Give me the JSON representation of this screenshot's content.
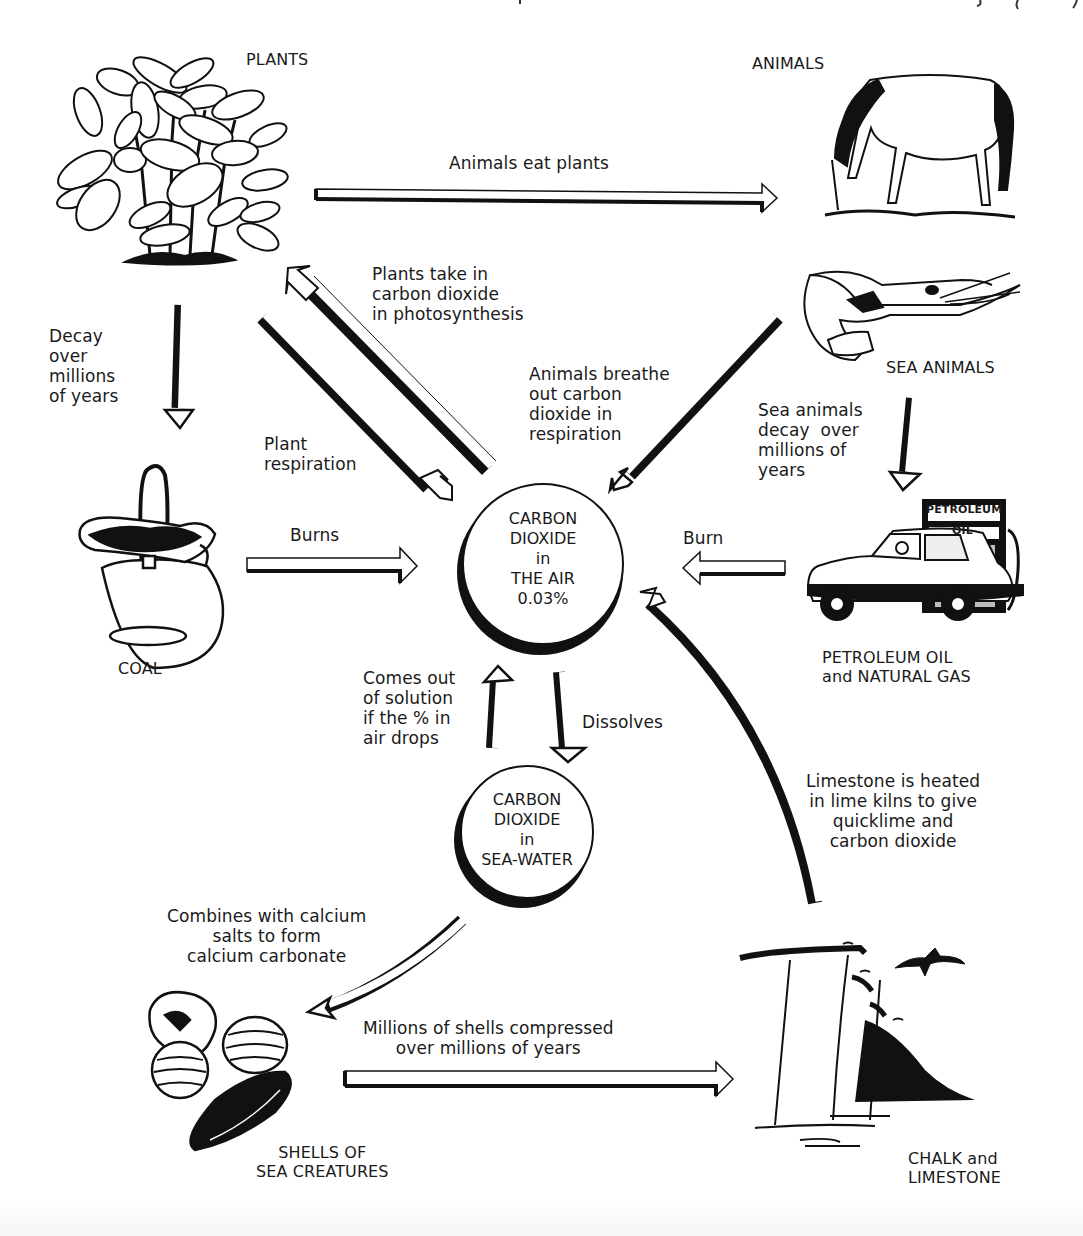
{
  "diagram": {
    "type": "carbon-cycle",
    "title_cut_off": "",
    "nodes": {
      "plants": {
        "label": "PLANTS"
      },
      "animals": {
        "label": "ANIMALS"
      },
      "sea_animals": {
        "label": "SEA ANIMALS"
      },
      "coal": {
        "label": "COAL"
      },
      "petroleum": {
        "label": "PETROLEUM OIL\nand NATURAL GAS",
        "pump_sign_top": "PETROLEUM",
        "pump_sign_bottom": "OIL"
      },
      "co2_air": {
        "label": "CARBON\nDIOXIDE\nin\nTHE AIR\n0.03%"
      },
      "co2_sea": {
        "label": "CARBON\nDIOXIDE\nin\nSEA-WATER"
      },
      "shells": {
        "label": "SHELLS OF\nSEA CREATURES"
      },
      "chalk": {
        "label": "CHALK and\nLIMESTONE"
      }
    },
    "edges": {
      "animals_eat_plants": "Animals eat plants",
      "photosynthesis": "Plants take in\ncarbon dioxide\nin photosynthesis",
      "plant_respiration": "Plant\nrespiration",
      "decay_plants": "Decay\nover\nmillions\nof years",
      "animal_respiration": "Animals breathe\nout carbon\ndioxide in\nrespiration",
      "sea_decay": "Sea animals\ndecay  over\nmillions of\nyears",
      "coal_burns": "Burns",
      "petroleum_burn": "Burn",
      "comes_out": "Comes out\nof solution\nif the % in\nair drops",
      "dissolves": "Dissolves",
      "limestone_heated": "Limestone is heated\nin lime kilns to give\nquicklime and\ncarbon dioxide",
      "combines_calcium": "Combines with calcium\nsalts to form\ncalcium carbonate",
      "shells_compressed": "Millions of shells compressed\nover millions of years"
    },
    "colors": {
      "ink": "#1a1a1a",
      "background": "#ffffff",
      "pump_shade": "#bdbdbd"
    }
  }
}
